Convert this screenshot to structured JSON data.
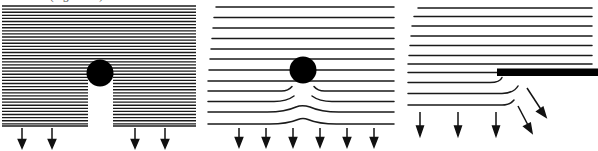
{
  "figure": {
    "caption_above": "resistance (Figure 4.4).",
    "background_color": "#ffffff",
    "line_color": "#1a1a1a",
    "obstacle_color": "#000000",
    "arrow_color": "#111111"
  },
  "panels": [
    {
      "id": "left",
      "name": "dense-hatch-panel",
      "description": "Dense horizontal flow lines with circular obstacle and vertical drainage channel below",
      "hatch": {
        "line_count": 46,
        "spacing_px": 3.1,
        "stroke_width": 1.35,
        "top_y": 6,
        "bottom_y": 146
      },
      "obstacle": {
        "shape": "circle",
        "cx": 100,
        "cy": 73,
        "r": 13.5,
        "color": "#000000"
      },
      "channel": {
        "shape": "vertical-gap",
        "x_left": 88,
        "x_right": 113,
        "y_top": 73,
        "y_bottom": 126,
        "fill": "#ffffff"
      },
      "arrows": {
        "count": 4,
        "direction": "down",
        "y_start": 127,
        "y_end": 147,
        "x_positions": [
          22,
          52,
          135,
          165
        ]
      }
    },
    {
      "id": "middle",
      "name": "sparse-lines-circle-panel",
      "description": "Widely spaced horizontal flow lines deflecting around a circular obstacle",
      "lines": {
        "line_count": 12,
        "spacing_px": 10.8,
        "stroke_width": 1.5,
        "top_y": 7,
        "x_left": 8,
        "x_right": 188
      },
      "obstacle": {
        "shape": "circle",
        "cx": 97,
        "cy": 70,
        "r": 13.5,
        "color": "#000000"
      },
      "deflection": {
        "description": "Lower flow lines curve downward beneath the obstacle",
        "affected_lines": 4,
        "center_x": 97
      },
      "arrows": {
        "count": 6,
        "direction": "down",
        "y_start": 126,
        "y_end": 146,
        "x_positions": [
          33,
          60,
          87,
          114,
          141,
          168
        ]
      }
    },
    {
      "id": "right",
      "name": "barrier-plate-panel",
      "description": "Horizontal flow lines truncated by a thick impermeable barrier plate at right",
      "lines": {
        "line_count": 10,
        "spacing_px": 11.5,
        "stroke_width": 1.5,
        "top_y": 10,
        "x_left": 5,
        "x_right": 186
      },
      "barrier": {
        "shape": "thick-bar",
        "x_left": 91,
        "x_right": 192,
        "y": 72,
        "thickness": 7,
        "color": "#000000"
      },
      "curl_lines": {
        "description": "Flow lines terminate and curl upward just left of the barrier edge",
        "count": 3,
        "edge_x": 95
      },
      "arrows_vertical": {
        "count": 3,
        "direction": "down",
        "y_start": 122,
        "y_end": 142,
        "x_positions": [
          14,
          52,
          90
        ]
      },
      "arrows_diagonal": {
        "count": 2,
        "direction": "down-right",
        "items": [
          {
            "x1": 113,
            "y1": 110,
            "x2": 125,
            "y2": 131
          },
          {
            "x1": 122,
            "y1": 91,
            "x2": 140,
            "y2": 116
          }
        ]
      }
    }
  ]
}
